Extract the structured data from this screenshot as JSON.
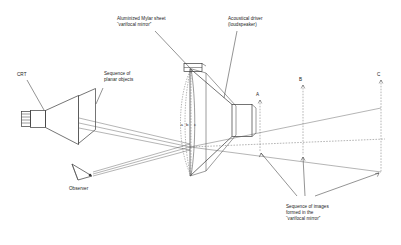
{
  "figure": {
    "background_color": "#ffffff",
    "line_color": "#3a3a3a",
    "text_color": "#1a1a1a",
    "width": 401,
    "height": 245
  },
  "labels": {
    "crt": "CRT",
    "sequence_objects_line1": "Sequence of",
    "sequence_objects_line2": "planar objects",
    "mylar_line1": "Aluminized Mylar sheet",
    "mylar_line2": "“varifocal mirror”",
    "driver_line1": "Acoustical driver",
    "driver_line2": "(loudspeaker)",
    "observer": "Observer",
    "images_line1": "Sequence of images",
    "images_line2": "formed in the",
    "images_line3": "“varifocal mirror”"
  },
  "mirror_positions": {
    "a": "a",
    "b": "b",
    "c": "c"
  },
  "image_planes": {
    "a": "A",
    "b": "B",
    "c": "C"
  }
}
